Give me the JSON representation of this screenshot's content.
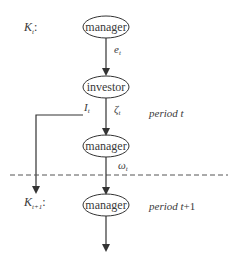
{
  "diagram": {
    "state_labels": [
      {
        "main": "K",
        "sub": "t",
        "suffix": ":"
      },
      {
        "main": "K",
        "sub": "t+1",
        "suffix": ":"
      }
    ],
    "nodes": [
      {
        "id": "manager-1",
        "label": "manager"
      },
      {
        "id": "investor",
        "label": "investor"
      },
      {
        "id": "manager-2",
        "label": "manager"
      },
      {
        "id": "manager-3",
        "label": "manager"
      }
    ],
    "edge_labels": {
      "e": {
        "main": "e",
        "sub": "t"
      },
      "zeta": {
        "main": "ζ",
        "sub": "t"
      },
      "i": {
        "main": "I",
        "sub": "t"
      },
      "omega": {
        "main": "ω",
        "sub": "t"
      }
    },
    "period_labels": {
      "period_t": {
        "word": "period",
        "var": "t"
      },
      "period_t1": {
        "word": "period",
        "var": "t",
        "plus": "+1"
      }
    },
    "colors": {
      "stroke": "#333333",
      "text": "#3a3a3a",
      "dash": "#555555"
    }
  }
}
